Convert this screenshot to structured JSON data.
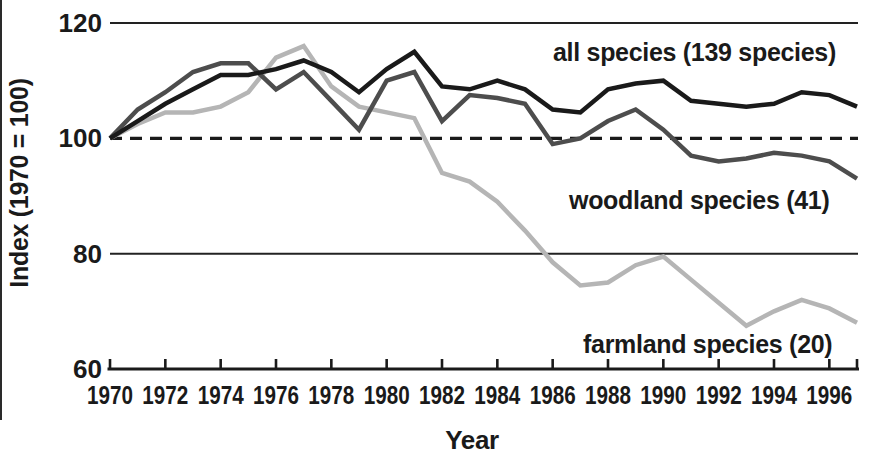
{
  "figure": {
    "background": "#ffffff",
    "text_color": "#1a1a1a"
  },
  "chart_data": {
    "type": "line",
    "title": "",
    "xlabel": "Year",
    "ylabel": "Index (1970 = 100)",
    "xlim": [
      1970,
      1997
    ],
    "ylim": [
      60,
      120
    ],
    "x_ticks": [
      1970,
      1972,
      1974,
      1976,
      1978,
      1980,
      1982,
      1984,
      1986,
      1988,
      1990,
      1992,
      1994,
      1996
    ],
    "y_ticks": [
      60,
      80,
      100,
      120
    ],
    "solid_gridlines_at": [
      80,
      120
    ],
    "dashed_reference_at": 100,
    "grid": "horizontal-only",
    "legend_position": "inline-labels",
    "x": [
      1970,
      1971,
      1972,
      1973,
      1974,
      1975,
      1976,
      1977,
      1978,
      1979,
      1980,
      1981,
      1982,
      1983,
      1984,
      1985,
      1986,
      1987,
      1988,
      1989,
      1990,
      1991,
      1992,
      1993,
      1994,
      1995,
      1996,
      1997
    ],
    "series": [
      {
        "name": "all_species",
        "label": "all species (139 species)",
        "color": "#1a1a1a",
        "values": [
          100,
          103,
          106,
          108.5,
          111,
          111,
          112,
          113.5,
          111.5,
          108,
          112,
          115,
          109,
          108.5,
          110,
          108.5,
          105,
          104.5,
          108.5,
          109.5,
          110,
          106.5,
          106,
          105.5,
          106,
          108,
          107.5,
          105.5
        ]
      },
      {
        "name": "woodland_species",
        "label": "woodland species (41)",
        "color": "#4d4d4d",
        "values": [
          100,
          105,
          108,
          111.5,
          113,
          113,
          108.5,
          111.5,
          106.5,
          101.5,
          110,
          111.5,
          103,
          107.5,
          107,
          106,
          99,
          100,
          103,
          105,
          101.5,
          97,
          96,
          96.5,
          97.5,
          97,
          96,
          93
        ]
      },
      {
        "name": "farmland_species",
        "label": "farmland species (20)",
        "color": "#b5b5b5",
        "values": [
          100,
          102.5,
          104.5,
          104.5,
          105.5,
          108,
          114,
          116,
          109,
          105.5,
          104.5,
          103.5,
          94,
          92.5,
          89,
          84,
          78.5,
          74.5,
          75,
          78,
          79.5,
          75.5,
          71.5,
          67.5,
          70,
          72,
          70.5,
          68
        ]
      }
    ]
  }
}
